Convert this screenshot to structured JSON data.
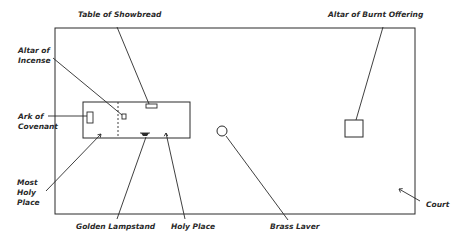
{
  "diagram": {
    "type": "floor-plan",
    "colors": {
      "ink": "#2a2a2a",
      "background": "#ffffff"
    },
    "labels": {
      "table_of_showbread": "Table of Showbread",
      "altar_of_burnt_offering": "Altar of Burnt Offering",
      "altar_of_incense_line1": "Altar of",
      "altar_of_incense_line2": "Incense",
      "ark_line1": "Ark of",
      "ark_line2": "Covenant",
      "most_holy_line1": "Most",
      "most_holy_line2": "Holy",
      "most_holy_line3": "Place",
      "golden_lampstand": "Golden Lampstand",
      "holy_place": "Holy Place",
      "brass_laver": "Brass Laver",
      "court": "Court"
    }
  }
}
